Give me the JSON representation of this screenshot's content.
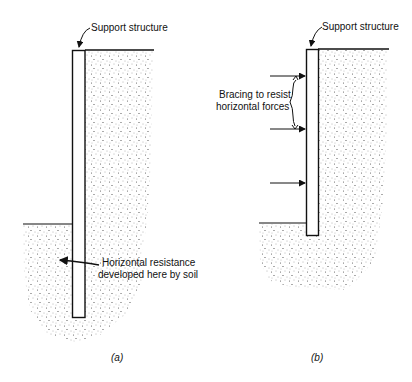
{
  "diagram": {
    "panels": [
      {
        "id": "a",
        "caption": "(a)",
        "labels": {
          "support": "Support structure",
          "resistance_line1": "Horizontal resistance",
          "resistance_line2": "developed here by soil"
        }
      },
      {
        "id": "b",
        "caption": "(b)",
        "labels": {
          "support": "Support structure",
          "bracing_line1": "Bracing to resist",
          "bracing_line2": "horizontal forces"
        },
        "bracing_arrow_count": 3
      }
    ],
    "colors": {
      "ink": "#111111",
      "soil_dot": "#555555",
      "background": "#ffffff"
    }
  }
}
